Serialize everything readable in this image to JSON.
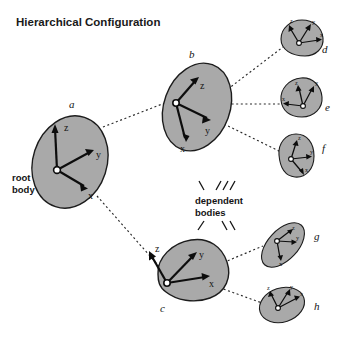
{
  "figure": {
    "title": "Hierarchical Configuration",
    "width": 344,
    "height": 337,
    "background": "#ffffff",
    "body_fill": "#a9a9a9",
    "body_stroke": "#1c1c1c",
    "axis_color": "#0d0d0d",
    "connector_color": "#2b2b2b",
    "text_color": "#141414"
  },
  "annotations": {
    "root_body_line1": "root",
    "root_body_line2": "body",
    "dependent_line1": "dependent",
    "dependent_line2": "bodies"
  },
  "axis_names": {
    "x": "x",
    "y": "y",
    "z": "z"
  },
  "bodies": [
    {
      "id": "a",
      "label": "a",
      "role": "root body",
      "label_x": 69,
      "label_y": 108,
      "axis_labels": {
        "x": "x",
        "y": "y",
        "z": "z"
      }
    },
    {
      "id": "b",
      "label": "b",
      "role": "dependent body",
      "parent": "a",
      "label_x": 189,
      "label_y": 58,
      "axis_labels": {
        "x": "x",
        "y": "y",
        "z": "z"
      }
    },
    {
      "id": "c",
      "label": "c",
      "role": "dependent body",
      "parent": "a",
      "label_x": 160,
      "label_y": 312,
      "axis_labels": {
        "x": "x",
        "y": "y",
        "z": "z"
      }
    },
    {
      "id": "d",
      "label": "d",
      "role": "dependent body",
      "parent": "b",
      "label_x": 322,
      "label_y": 53,
      "axis_labels": {
        "x": "x",
        "y": "y",
        "z": "z"
      }
    },
    {
      "id": "e",
      "label": "e",
      "role": "dependent body",
      "parent": "b",
      "label_x": 325,
      "label_y": 111,
      "axis_labels": {
        "x": "x",
        "y": "y",
        "z": "z"
      }
    },
    {
      "id": "f",
      "label": "f",
      "role": "dependent body",
      "parent": "b",
      "label_x": 322,
      "label_y": 152,
      "axis_labels": {
        "x": "x",
        "y": "y",
        "z": "z"
      }
    },
    {
      "id": "g",
      "label": "g",
      "role": "dependent body",
      "parent": "c",
      "label_x": 314,
      "label_y": 240,
      "axis_labels": {
        "x": "x",
        "y": "y",
        "z": "z"
      }
    },
    {
      "id": "h",
      "label": "h",
      "role": "dependent body",
      "parent": "c",
      "label_x": 314,
      "label_y": 310,
      "axis_labels": {
        "x": "x",
        "y": "y",
        "z": "z"
      }
    }
  ],
  "connections": [
    {
      "from": "a",
      "to": "b"
    },
    {
      "from": "a",
      "to": "c"
    },
    {
      "from": "b",
      "to": "d"
    },
    {
      "from": "b",
      "to": "e"
    },
    {
      "from": "b",
      "to": "f"
    },
    {
      "from": "c",
      "to": "g"
    },
    {
      "from": "c",
      "to": "h"
    }
  ]
}
